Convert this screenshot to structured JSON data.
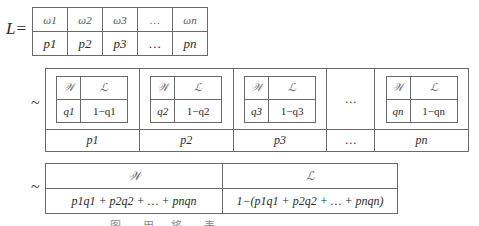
{
  "distribution_L": {
    "label": "L=",
    "outcomes": [
      "ω1",
      "ω2",
      "ω3",
      "…",
      "ωn"
    ],
    "probabilities": [
      "p1",
      "p2",
      "p3",
      "…",
      "pn"
    ]
  },
  "compound_lottery": {
    "tilde": "~",
    "sub_lotteries": [
      {
        "header": [
          "𝒲",
          "ℒ"
        ],
        "values": [
          "q1",
          "1−q1"
        ],
        "prob": "p1"
      },
      {
        "header": [
          "𝒲",
          "ℒ"
        ],
        "values": [
          "q2",
          "1−q2"
        ],
        "prob": "p2"
      },
      {
        "header": [
          "𝒲",
          "ℒ"
        ],
        "values": [
          "q3",
          "1−q3"
        ],
        "prob": "p3"
      },
      {
        "ellipsis": "…",
        "prob": "…"
      },
      {
        "header": [
          "𝒲",
          "ℒ"
        ],
        "values": [
          "qn",
          "1−qn"
        ],
        "prob": "pn"
      }
    ]
  },
  "reduced_lottery": {
    "tilde": "~",
    "header": [
      "𝒲",
      "ℒ"
    ],
    "values": [
      "p1q1 + p2q2 + … + pnqn",
      "1−(p1q1 + p2q2 + … + pnqn)"
    ]
  },
  "caption": "图 … 用 …将 … 表 …"
}
